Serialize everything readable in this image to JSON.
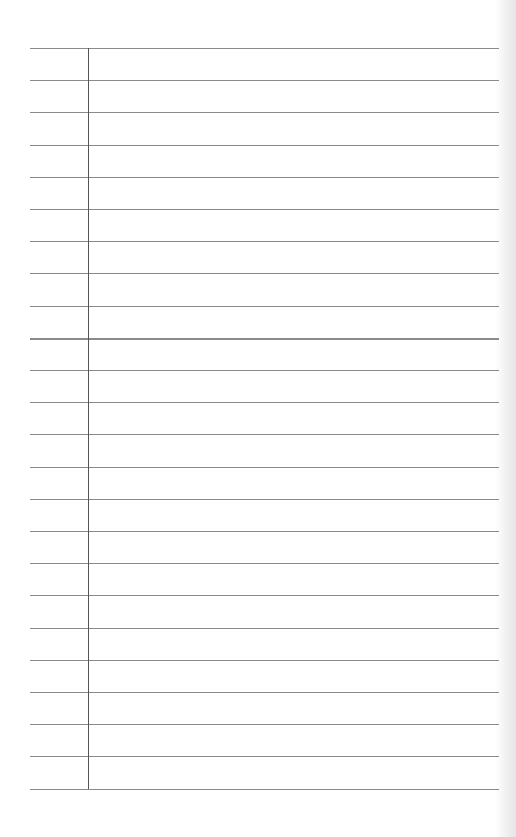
{
  "paper": {
    "type": "ruled-notebook-page",
    "rule_count": 24,
    "first_rule_y": 48,
    "rule_spacing": 32.2,
    "thick_rule_index": 9,
    "rule_left": 30,
    "rule_right": 499,
    "margin_x": 88,
    "colors": {
      "background": "#ffffff",
      "rule": "#8a8a8a",
      "margin": "#555555"
    }
  }
}
